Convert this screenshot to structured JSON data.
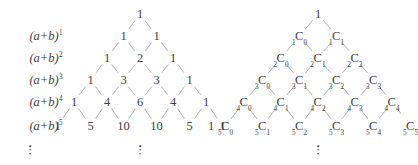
{
  "figure": {
    "kind": "pascals-triangle-pair",
    "ellipsis_glyph": "vertical-ellipsis"
  },
  "row_labels": [
    {
      "text": "(a+b)",
      "exponent": "1"
    },
    {
      "text": "(a+b)",
      "exponent": "2"
    },
    {
      "text": "(a+b)",
      "exponent": "3"
    },
    {
      "text": "(a+b)",
      "exponent": "4"
    },
    {
      "text": "(a+b)",
      "exponent": "5"
    }
  ],
  "left_triangle": {
    "apex": "1",
    "rows": [
      {
        "values": [
          "1",
          "1"
        ]
      },
      {
        "values": [
          "1",
          "2",
          "1"
        ]
      },
      {
        "values": [
          "1",
          "3",
          "3",
          "1"
        ]
      },
      {
        "values": [
          "1",
          "4",
          "6",
          "4",
          "1"
        ]
      },
      {
        "values": [
          "1",
          "5",
          "10",
          "10",
          "5",
          "1"
        ]
      }
    ]
  },
  "right_triangle": {
    "apex": "1",
    "outer_one": "1",
    "rows": [
      {
        "terms": [
          {
            "n": "1",
            "r": "0"
          },
          {
            "n": "1",
            "r": "1"
          }
        ]
      },
      {
        "terms": [
          {
            "n": "2",
            "r": "0"
          },
          {
            "n": "2",
            "r": "1"
          },
          {
            "n": "2",
            "r": "2"
          }
        ]
      },
      {
        "terms": [
          {
            "n": "3",
            "r": "0"
          },
          {
            "n": "3",
            "r": "1"
          },
          {
            "n": "3",
            "r": "2"
          },
          {
            "n": "3",
            "r": "3"
          }
        ]
      },
      {
        "terms": [
          {
            "n": "4",
            "r": "0"
          },
          {
            "n": "4",
            "r": "1"
          },
          {
            "n": "4",
            "r": "2"
          },
          {
            "n": "4",
            "r": "3"
          },
          {
            "n": "4",
            "r": "4"
          }
        ]
      },
      {
        "terms": [
          {
            "n": "5",
            "r": "0"
          },
          {
            "n": "5",
            "r": "1"
          },
          {
            "n": "5",
            "r": "2"
          },
          {
            "n": "5",
            "r": "3"
          },
          {
            "n": "5",
            "r": "4"
          },
          {
            "n": "5",
            "r": "5"
          }
        ]
      }
    ]
  },
  "colors": {
    "text": "#3d3d3d",
    "line": "#9a9a9a",
    "background": "#ffffff"
  },
  "layout": {
    "label_x": 46,
    "left_apex_x": 140,
    "right_apex_x": 318,
    "left_spacing": 33,
    "right_spacing": 37,
    "row_y": [
      14,
      36,
      58,
      80,
      102,
      126
    ],
    "dots_y": 150,
    "left_outer_one_x": 72,
    "right_outer_one_x": 211
  }
}
